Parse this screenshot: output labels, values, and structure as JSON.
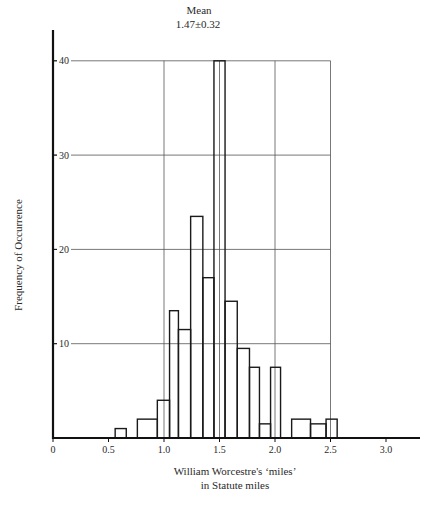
{
  "chart_data": {
    "type": "bar",
    "subtype": "histogram",
    "title": "",
    "annotation": {
      "label": "Mean",
      "value": "1.47±0.32",
      "x": 1.47
    },
    "xlabel": "William Worcestre's ‘miles’ in Statute miles",
    "xlabel_lines": [
      "William Worcestre's ‘miles’",
      "in Statute miles"
    ],
    "ylabel": "Frequency of Occurrence",
    "xlim": [
      0,
      3.3
    ],
    "ylim": [
      0,
      43
    ],
    "xticks": [
      0,
      0.5,
      1.0,
      1.5,
      2.0,
      2.5,
      3.0
    ],
    "xtick_labels": [
      "0",
      "0.5",
      "1.0",
      "1.5",
      "2.0",
      "2.5",
      "3.0"
    ],
    "yticks": [
      10,
      20,
      30,
      40
    ],
    "ytick_labels": [
      "10",
      "20",
      "30",
      "40"
    ],
    "grid": {
      "on": true,
      "horizontal": [
        10,
        20,
        30,
        40
      ],
      "vertical": [
        1.0,
        1.5,
        2.0,
        2.5
      ],
      "x_extent": [
        0,
        2.5
      ]
    },
    "bins": [
      {
        "x0": 0.56,
        "x1": 0.66,
        "count": 1
      },
      {
        "x0": 0.76,
        "x1": 0.94,
        "count": 2
      },
      {
        "x0": 0.94,
        "x1": 1.05,
        "count": 4
      },
      {
        "x0": 1.05,
        "x1": 1.13,
        "count": 13.5
      },
      {
        "x0": 1.13,
        "x1": 1.24,
        "count": 11.5
      },
      {
        "x0": 1.24,
        "x1": 1.35,
        "count": 23.5
      },
      {
        "x0": 1.35,
        "x1": 1.45,
        "count": 17
      },
      {
        "x0": 1.45,
        "x1": 1.55,
        "count": 40
      },
      {
        "x0": 1.55,
        "x1": 1.66,
        "count": 14.5
      },
      {
        "x0": 1.66,
        "x1": 1.77,
        "count": 9.5
      },
      {
        "x0": 1.77,
        "x1": 1.86,
        "count": 7.5
      },
      {
        "x0": 1.86,
        "x1": 1.96,
        "count": 1.5
      },
      {
        "x0": 1.96,
        "x1": 2.05,
        "count": 7.5
      },
      {
        "x0": 2.15,
        "x1": 2.32,
        "count": 2
      },
      {
        "x0": 2.32,
        "x1": 2.46,
        "count": 1.5
      },
      {
        "x0": 2.46,
        "x1": 2.56,
        "count": 2
      }
    ],
    "categories": [
      "0.6",
      "0.85",
      "1.0",
      "1.1",
      "1.2",
      "1.3",
      "1.4",
      "1.5",
      "1.6",
      "1.7",
      "1.8",
      "1.9",
      "2.0",
      "2.2",
      "2.4",
      "2.5"
    ],
    "values": [
      1,
      2,
      4,
      13.5,
      11.5,
      23.5,
      17,
      40,
      14.5,
      9.5,
      7.5,
      1.5,
      7.5,
      2,
      1.5,
      2
    ],
    "legend": null,
    "colors": {
      "line": "#1a1a1a",
      "grid": "#555555",
      "background": "#ffffff"
    }
  }
}
